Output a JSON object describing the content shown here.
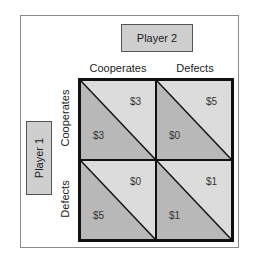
{
  "players": {
    "player1": "Player 1",
    "player2": "Player 2"
  },
  "columns": [
    "Cooperates",
    "Defects"
  ],
  "rows": [
    "Cooperates",
    "Defects"
  ],
  "colors": {
    "upper_triangle": "#dcdcdc",
    "lower_triangle": "#b8b8b8",
    "border": "#111111"
  },
  "cells": [
    {
      "row": "Cooperates",
      "col": "Cooperates",
      "player2": "$3",
      "player1": "$3"
    },
    {
      "row": "Cooperates",
      "col": "Defects",
      "player2": "$5",
      "player1": "$0"
    },
    {
      "row": "Defects",
      "col": "Cooperates",
      "player2": "$0",
      "player1": "$5"
    },
    {
      "row": "Defects",
      "col": "Defects",
      "player2": "$1",
      "player1": "$1"
    }
  ]
}
